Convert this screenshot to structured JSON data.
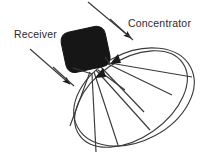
{
  "figure": {
    "kind": "technical-line-diagram",
    "width": 206,
    "height": 168,
    "background_color": "#ffffff",
    "line_color": "#3a3a3a",
    "receiver_fill_color": "#161616",
    "text_color": "#2b2b2b"
  },
  "labels": {
    "receiver": "Receiver",
    "concentrator": "Concentrator"
  },
  "parts": {
    "receiver_name": "receiver-block",
    "concentrator_name": "parabolic-dish",
    "rim_name": "dish-rim-ellipse",
    "incoming_rays_name": "incoming-solar-rays",
    "reflected_rays_name": "reflected-concentrated-rays"
  },
  "annotations": {
    "incoming_ray_count": 2,
    "reflected_ray_count": 6,
    "arrowhead_count": 4
  }
}
